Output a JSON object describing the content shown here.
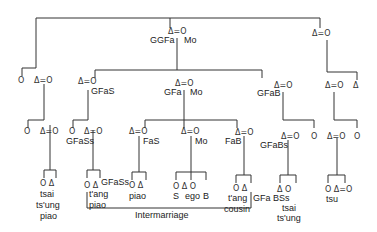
{
  "diagram": {
    "type": "kinship",
    "symbols": {
      "male": "Δ",
      "female": "O",
      "marriage": "="
    },
    "labels": {
      "ggfa": "GGFa",
      "ggmo": "Mo",
      "gfas": "GFaS",
      "gfa": "GFa",
      "gmo": "Mo",
      "gfab": "GFaB",
      "gfass_left": "GFaSs",
      "fas": "FaS",
      "mo": "Mo",
      "fab": "FaB",
      "gfabs": "GFaBs",
      "tsai1": "tsai",
      "tsung1": "ts'ung",
      "piao1": "piao",
      "tang1": "t'ang",
      "piao2": "piao",
      "gfass_mid": "GFaSs",
      "piao3": "piao",
      "s": "S",
      "ego": "ego",
      "b": "B",
      "tang2": "t'ang",
      "cousin": "cousin",
      "gfabss": "GFa BSs",
      "tsai2": "tsai",
      "tsung2": "ts'ung",
      "tsu": "tsu",
      "intermarriage": "Intermarriage"
    }
  }
}
